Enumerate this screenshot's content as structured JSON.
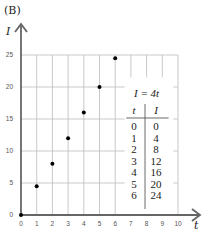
{
  "panel_label": "(B)",
  "chart_data": {
    "type": "scatter",
    "title": "",
    "xlabel": "t",
    "ylabel": "I",
    "xlim": [
      0,
      10
    ],
    "ylim": [
      0,
      25
    ],
    "x_ticks": [
      "0",
      "1",
      "2",
      "3",
      "4",
      "5",
      "6",
      "7",
      "8",
      "9",
      "10"
    ],
    "y_ticks": [
      "0",
      "5",
      "10",
      "15",
      "20",
      "25"
    ],
    "grid": true,
    "x": [
      0,
      1,
      2,
      3,
      4,
      5,
      6
    ],
    "y": [
      0,
      4.5,
      8,
      12,
      16,
      20,
      24.5
    ],
    "series": [
      {
        "name": "I = 4t",
        "x": [
          0,
          1,
          2,
          3,
          4,
          5,
          6
        ],
        "values": [
          0,
          4,
          8,
          12,
          16,
          20,
          24
        ]
      }
    ],
    "annotations": [
      "I = 4t"
    ]
  },
  "table": {
    "equation": "I = 4t",
    "headers": [
      "t",
      "I"
    ],
    "rows": [
      [
        "0",
        "0"
      ],
      [
        "1",
        "4"
      ],
      [
        "2",
        "8"
      ],
      [
        "3",
        "12"
      ],
      [
        "4",
        "16"
      ],
      [
        "5",
        "20"
      ],
      [
        "6",
        "24"
      ]
    ]
  },
  "colors": {
    "axis": "#666666",
    "grid": "#bbbbbb",
    "point": "#000000",
    "text": "#222222"
  }
}
